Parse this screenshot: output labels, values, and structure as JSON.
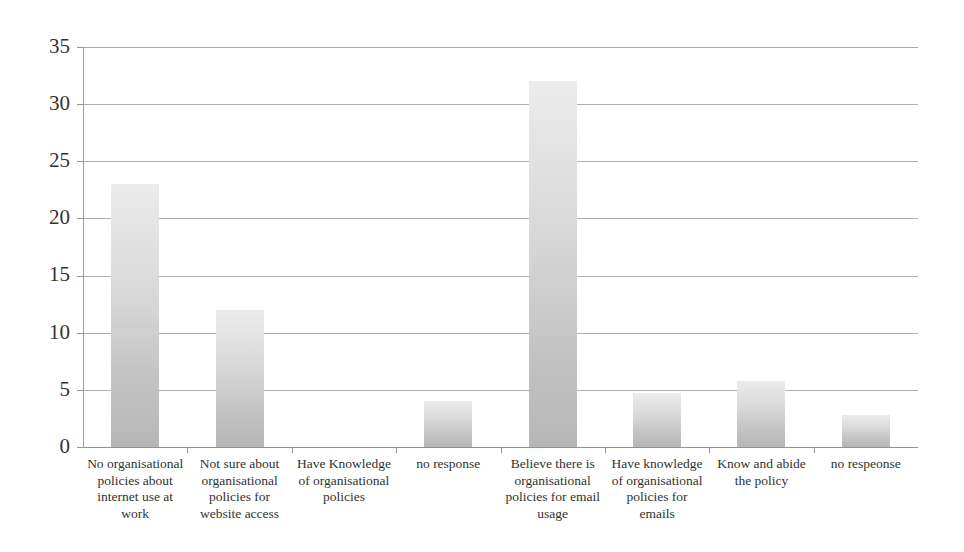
{
  "chart_data": {
    "type": "bar",
    "title": "",
    "subtitle": "",
    "xlabel": "",
    "ylabel": "",
    "ylim": [
      0,
      35
    ],
    "ytick_step": 5,
    "yticks": [
      "0",
      "5",
      "10",
      "15",
      "20",
      "25",
      "30",
      "35"
    ],
    "grid": true,
    "legend": false,
    "legend_position": "none",
    "orientation": "vertical",
    "bar_color": "#d4d4d4",
    "bar_gradient_top": "#ebebeb",
    "bar_gradient_bottom": "#b2b2b2",
    "gridline_color": "#a9a9a9",
    "axis_color": "#8f8f8f",
    "categories": [
      "No organisational policies about internet use at work",
      "Not sure about organisational policies for website access",
      "Have Knowledge of organisational policies",
      "no response",
      "Believe there is organisational policies for email usage",
      "Have knowledge of organisational policies for emails",
      "Know and abide the policy",
      "no respeonse"
    ],
    "category_lines": [
      [
        "No organisational",
        "policies about",
        "internet use at",
        "work"
      ],
      [
        "Not sure about",
        "organisational",
        "policies for",
        "website access"
      ],
      [
        "Have Knowledge",
        "of organisational",
        "policies"
      ],
      [
        "no response"
      ],
      [
        "Believe there is",
        "organisational",
        "policies for email",
        "usage"
      ],
      [
        "Have knowledge",
        "of organisational",
        "policies for",
        "emails"
      ],
      [
        "Know and abide",
        "the policy"
      ],
      [
        "no respeonse"
      ]
    ],
    "values": [
      23,
      12,
      0,
      4,
      32,
      4.7,
      5.8,
      2.8
    ],
    "value_labels": [
      "23",
      "12",
      "0",
      "4",
      "32",
      "4.7",
      "5.8",
      "2.8"
    ],
    "series": [
      {
        "name": "Responses",
        "values": [
          23,
          12,
          0,
          4,
          32,
          4.7,
          5.8,
          2.8
        ]
      }
    ]
  }
}
